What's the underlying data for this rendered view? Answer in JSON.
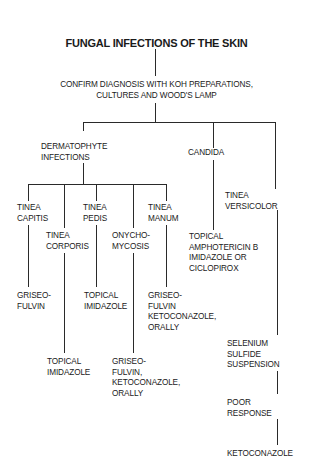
{
  "title": "FUNGAL INFECTIONS OF THE SKIN",
  "confirm": {
    "line1": "CONFIRM DIAGNOSIS WITH KOH PREPARATIONS,",
    "line2": "CULTURES AND WOOD'S LAMP"
  },
  "branches": {
    "dermatophyte": {
      "line1": "DERMATOPHYTE",
      "line2": "INFECTIONS",
      "subtypes": {
        "capitis": {
          "line1": "TINEA",
          "line2": "CAPITIS",
          "treatment": [
            "GRISEO-",
            "FULVIN"
          ]
        },
        "corporis": {
          "line1": "TINEA",
          "line2": "CORPORIS",
          "treatment": [
            "TOPICAL",
            "IMIDAZOLE"
          ]
        },
        "pedis": {
          "line1": "TINEA",
          "line2": "PEDIS",
          "treatment": [
            "TOPICAL",
            "IMIDAZOLE"
          ]
        },
        "onychomycosis": {
          "line1": "ONYCHO-",
          "line2": "MYCOSIS",
          "treatment": [
            "GRISEO-",
            "FULVIN,",
            "KETOCONAZOLE,",
            "ORALLY"
          ]
        },
        "manum": {
          "line1": "TINEA",
          "line2": "MANUM",
          "treatment": [
            "GRISEO-",
            "FULVIN",
            "KETOCONAZOLE,",
            "ORALLY"
          ]
        }
      }
    },
    "candida": {
      "label": "CANDIDA",
      "treatment": [
        "TOPICAL",
        "AMPHOTERICIN B",
        "IMIDAZOLE OR",
        "CICLOPIROX"
      ]
    },
    "versicolor": {
      "line1": "TINEA",
      "line2": "VERSICOLOR",
      "step1": [
        "SELENIUM",
        "SULFIDE",
        "SUSPENSION"
      ],
      "step2": [
        "POOR",
        "RESPONSE"
      ],
      "step3": "KETOCONAZOLE"
    }
  }
}
